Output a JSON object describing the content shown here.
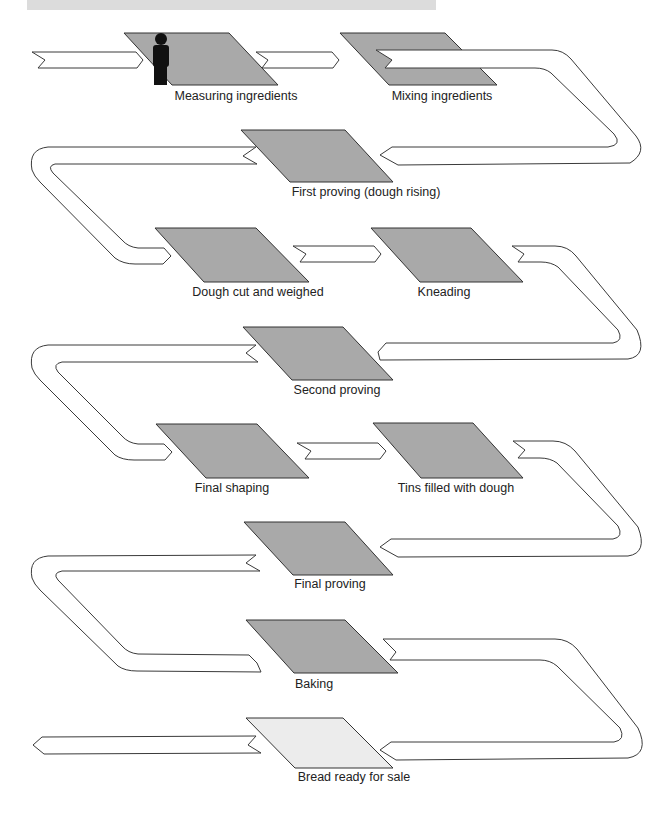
{
  "diagram": {
    "type": "process-flow",
    "title_band": "",
    "colors": {
      "step_fill": "#a9a9a9",
      "final_step_fill": "#ececec",
      "ribbon_fill": "#ffffff",
      "outline": "#333333",
      "header_band": "#dcdcdc",
      "person_icon": "#111111"
    },
    "steps": [
      {
        "id": 1,
        "label": "Measuring ingredients",
        "icon": "person-icon"
      },
      {
        "id": 2,
        "label": "Mixing ingredients"
      },
      {
        "id": 3,
        "label": "First proving (dough rising)"
      },
      {
        "id": 4,
        "label": "Dough cut and weighed"
      },
      {
        "id": 5,
        "label": "Kneading"
      },
      {
        "id": 6,
        "label": "Second proving"
      },
      {
        "id": 7,
        "label": "Final shaping"
      },
      {
        "id": 8,
        "label": "Tins filled with dough"
      },
      {
        "id": 9,
        "label": "Final proving"
      },
      {
        "id": 10,
        "label": "Baking"
      },
      {
        "id": 11,
        "label": "Bread ready for sale",
        "highlight": "final"
      }
    ],
    "flow_order": [
      "Measuring ingredients",
      "Mixing ingredients",
      "First proving (dough rising)",
      "Dough cut and weighed",
      "Kneading",
      "Second proving",
      "Final shaping",
      "Tins filled with dough",
      "Final proving",
      "Baking",
      "Bread ready for sale"
    ]
  }
}
